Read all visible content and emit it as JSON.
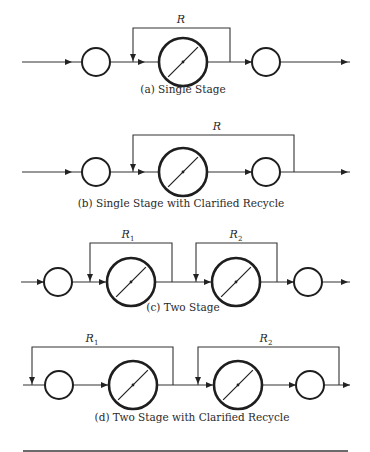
{
  "colors": {
    "stroke": "#1e1e1e",
    "background": "#ffffff",
    "text": "#2a2a2a"
  },
  "diagrams": [
    {
      "id": "a",
      "caption": "(a)  Single Stage",
      "caption_pos": [
        183,
        93
      ],
      "main_line": {
        "y": 62,
        "x_start": 22,
        "x_end": 350
      },
      "small_clarifiers": [
        96,
        266
      ],
      "reactors": [
        183
      ],
      "recycles": [
        {
          "label": "R",
          "sub": "",
          "x_left": 133,
          "x_right": 230,
          "top": 28,
          "label_x": 181,
          "label_y": 23
        }
      ],
      "arrows": [
        72,
        145,
        252,
        348
      ]
    },
    {
      "id": "b",
      "caption": "(b)  Single Stage with Clarified Recycle",
      "caption_pos": [
        181,
        207
      ],
      "main_line": {
        "y": 172,
        "x_start": 22,
        "x_end": 350
      },
      "small_clarifiers": [
        96,
        266
      ],
      "reactors": [
        183
      ],
      "recycles": [
        {
          "label": "R",
          "sub": "",
          "x_left": 133,
          "x_right": 294,
          "top": 135,
          "label_x": 217,
          "label_y": 130
        }
      ],
      "arrows": [
        72,
        145,
        252,
        348
      ]
    },
    {
      "id": "c",
      "caption": "(c)  Two Stage",
      "caption_pos": [
        183,
        311
      ],
      "main_line": {
        "y": 282,
        "x_start": 21,
        "x_end": 350
      },
      "small_clarifiers": [
        58,
        308
      ],
      "reactors": [
        131,
        236
      ],
      "recycles": [
        {
          "label": "R",
          "sub": "1",
          "x_left": 90,
          "x_right": 172,
          "top": 243,
          "label_x": 128,
          "label_y": 238
        },
        {
          "label": "R",
          "sub": "2",
          "x_left": 196,
          "x_right": 277,
          "top": 243,
          "label_x": 236,
          "label_y": 238
        }
      ],
      "arrows": [
        44,
        106,
        211,
        294,
        348
      ]
    },
    {
      "id": "d",
      "caption": "(d)  Two Stage with Clarified Recycle",
      "caption_pos": [
        192,
        421
      ],
      "main_line": {
        "y": 385,
        "x_start": 23,
        "x_end": 350
      },
      "small_clarifiers": [
        59,
        310
      ],
      "reactors": [
        133,
        238
      ],
      "recycles": [
        {
          "label": "R",
          "sub": "1",
          "x_left": 32,
          "x_right": 173,
          "top": 347,
          "label_x": 92,
          "label_y": 342
        },
        {
          "label": "R",
          "sub": "2",
          "x_left": 198,
          "x_right": 339,
          "top": 347,
          "label_x": 266,
          "label_y": 342
        }
      ],
      "arrows": [
        108,
        213,
        296,
        350
      ]
    }
  ],
  "geometry": {
    "small_radius": 14,
    "reactor_radius": 24
  },
  "bottom_rule": {
    "y": 451,
    "x1": 23,
    "x2": 348
  }
}
